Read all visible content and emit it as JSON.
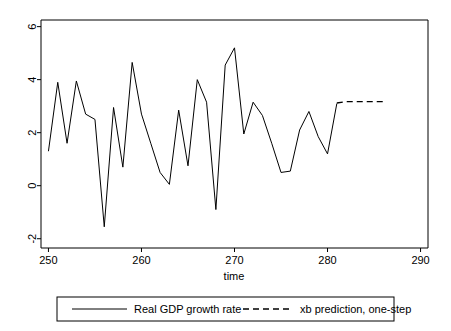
{
  "chart_data": {
    "type": "line",
    "title": "",
    "xlabel": "time",
    "ylabel": "",
    "xlim": [
      249.2,
      290.8
    ],
    "ylim": [
      -2.35,
      6.25
    ],
    "xticks": [
      250,
      260,
      270,
      280,
      290
    ],
    "yticks": [
      -2,
      0,
      2,
      4,
      6
    ],
    "xtick_labels": [
      "250",
      "260",
      "270",
      "280",
      "290"
    ],
    "ytick_labels": [
      "-2",
      "0",
      "2",
      "4",
      "6"
    ],
    "grid": false,
    "legend_position": "bottom",
    "background_color": "#ffffff",
    "line_color": "#000000",
    "series": [
      {
        "name": "Real GDP growth rate",
        "style": "solid",
        "color": "#000000",
        "x": [
          250,
          251,
          252,
          253,
          254,
          255,
          256,
          257,
          258,
          259,
          260,
          261,
          262,
          263,
          264,
          265,
          266,
          267,
          268,
          269,
          270,
          271,
          272,
          273,
          274,
          275,
          276,
          277,
          278,
          279,
          280,
          281
        ],
        "values": [
          1.3,
          3.9,
          1.6,
          3.95,
          2.7,
          2.5,
          -1.55,
          2.95,
          0.7,
          4.65,
          2.7,
          1.6,
          0.5,
          0.05,
          2.85,
          0.75,
          4.0,
          3.15,
          -0.9,
          4.55,
          5.2,
          1.95,
          3.15,
          2.65,
          1.6,
          0.5,
          0.55,
          2.1,
          2.8,
          1.85,
          1.2,
          3.1
        ]
      },
      {
        "name": "xb prediction, one-step",
        "style": "dashed",
        "color": "#000000",
        "x": [
          281,
          282,
          283,
          284,
          285,
          286
        ],
        "values": [
          3.12,
          3.17,
          3.17,
          3.17,
          3.17,
          3.17
        ]
      }
    ],
    "legend": [
      {
        "label": "Real GDP growth rate",
        "style": "solid"
      },
      {
        "label": "xb prediction, one-step",
        "style": "dashed"
      }
    ]
  },
  "axes": {
    "x_title": "time",
    "y_title": ""
  }
}
